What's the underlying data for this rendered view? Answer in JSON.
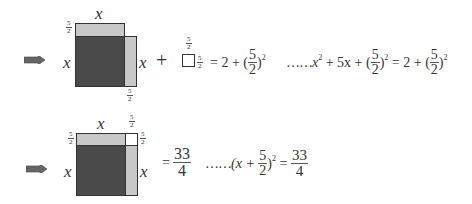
{
  "row1": {
    "arrow": "double-arrow-right",
    "labels": {
      "top_x": "x",
      "left_x": "x",
      "right_x": "x",
      "top_frac": {
        "num": "5",
        "den": "2"
      },
      "bottom_frac": {
        "num": "5",
        "den": "2"
      }
    },
    "plus": "+",
    "small_square_frac_top": {
      "num": "5",
      "den": "2"
    },
    "small_square_frac_right": {
      "num": "5",
      "den": "2"
    },
    "equation_left": {
      "eq": "= 2 + (",
      "frac": {
        "num": "5",
        "den": "2"
      },
      "close": ")",
      "exp": "2"
    },
    "equation_right": {
      "dots": "……",
      "t1": "x",
      "e1": "2",
      "t2": " + 5x + (",
      "frac1": {
        "num": "5",
        "den": "2"
      },
      "t3": ")",
      "e2": "2",
      "t4": " = 2 + (",
      "frac2": {
        "num": "5",
        "den": "2"
      },
      "t5": ")",
      "e3": "2"
    }
  },
  "row2": {
    "arrow": "double-arrow-right",
    "labels": {
      "top_x": "x",
      "left_x": "x",
      "right_x": "x",
      "top_left_frac": {
        "num": "5",
        "den": "2"
      },
      "top_right_frac": {
        "num": "5",
        "den": "2"
      },
      "right_top_frac": {
        "num": "5",
        "den": "2"
      }
    },
    "equation_left": {
      "eq": "=",
      "frac": {
        "num": "33",
        "den": "4"
      }
    },
    "equation_right": {
      "dots": "……",
      "t1": "(x + ",
      "frac1": {
        "num": "5",
        "den": "2"
      },
      "t2": ")",
      "e1": "2",
      "t3": " = ",
      "frac2": {
        "num": "33",
        "den": "4"
      }
    }
  },
  "colors": {
    "dark": "#4a4a4a",
    "light": "#c8c8c8",
    "arrow": "#555555",
    "stroke": "#333333"
  }
}
